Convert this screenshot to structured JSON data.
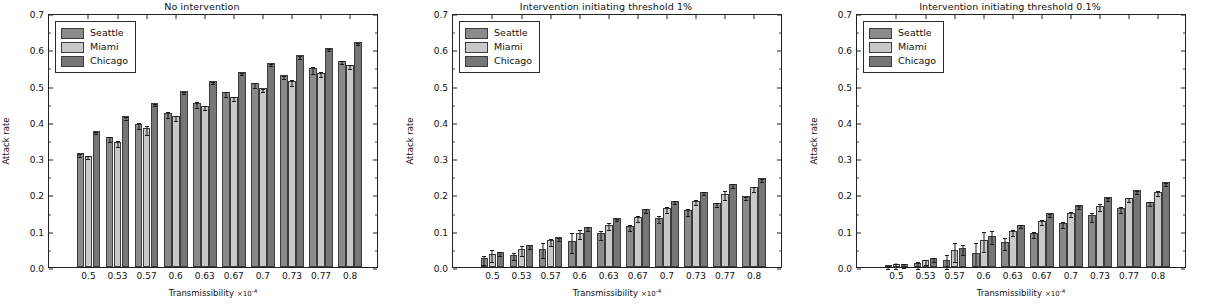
{
  "figure": {
    "xlabel": "Transmissibility",
    "xlabel_multiplier": "×10",
    "xlabel_exponent": "-4",
    "ylabel": "Attack rate"
  },
  "legend": {
    "entries": [
      {
        "label": "Seattle",
        "color": "#8a8a8a",
        "key": "seattle"
      },
      {
        "label": "Miami",
        "color": "#c9c9c9",
        "key": "miami"
      },
      {
        "label": "Chicago",
        "color": "#767676",
        "key": "chicago"
      }
    ]
  },
  "axis": {
    "yticks": [
      "0.0",
      "0.1",
      "0.2",
      "0.3",
      "0.4",
      "0.5",
      "0.6",
      "0.7"
    ],
    "ytick_values": [
      0.0,
      0.1,
      0.2,
      0.3,
      0.4,
      0.5,
      0.6,
      0.7
    ],
    "xticks": [
      "0.5",
      "0.53",
      "0.57",
      "0.6",
      "0.63",
      "0.67",
      "0.7",
      "0.73",
      "0.77",
      "0.8"
    ]
  },
  "chart_data": [
    {
      "type": "bar",
      "title": "No intervention",
      "xlabel": "Transmissibility ×10^-4",
      "ylabel": "Attack rate",
      "ylim": [
        0.0,
        0.7
      ],
      "grid": false,
      "legend_position": "upper left",
      "categories": [
        "0.5",
        "0.53",
        "0.57",
        "0.6",
        "0.63",
        "0.67",
        "0.7",
        "0.73",
        "0.77",
        "0.8"
      ],
      "series": [
        {
          "name": "Seattle",
          "values": [
            0.314,
            0.357,
            0.393,
            0.425,
            0.452,
            0.481,
            0.506,
            0.528,
            0.548,
            0.568
          ],
          "errors": [
            0.004,
            0.006,
            0.008,
            0.008,
            0.007,
            0.007,
            0.006,
            0.005,
            0.01,
            0.004
          ]
        },
        {
          "name": "Miami",
          "values": [
            0.307,
            0.345,
            0.382,
            0.415,
            0.444,
            0.469,
            0.492,
            0.513,
            0.536,
            0.556
          ],
          "errors": [
            0.005,
            0.008,
            0.013,
            0.008,
            0.005,
            0.005,
            0.005,
            0.008,
            0.006,
            0.006
          ]
        },
        {
          "name": "Chicago",
          "values": [
            0.375,
            0.415,
            0.452,
            0.484,
            0.512,
            0.538,
            0.562,
            0.583,
            0.603,
            0.621
          ],
          "errors": [
            0.003,
            0.003,
            0.003,
            0.003,
            0.003,
            0.003,
            0.003,
            0.003,
            0.003,
            0.003
          ]
        }
      ]
    },
    {
      "type": "bar",
      "title": "Intervention initiating threshold 1%",
      "xlabel": "Transmissibility ×10^-4",
      "ylabel": "Attack rate",
      "ylim": [
        0.0,
        0.7
      ],
      "grid": false,
      "legend_position": "upper left",
      "categories": [
        "0.5",
        "0.53",
        "0.57",
        "0.6",
        "0.63",
        "0.67",
        "0.7",
        "0.73",
        "0.77",
        "0.8"
      ],
      "series": [
        {
          "name": "Seattle",
          "values": [
            0.024,
            0.034,
            0.051,
            0.071,
            0.093,
            0.113,
            0.136,
            0.156,
            0.177,
            0.195
          ],
          "errors": [
            0.012,
            0.009,
            0.021,
            0.027,
            0.013,
            0.009,
            0.009,
            0.009,
            0.005,
            0.004
          ]
        },
        {
          "name": "Miami",
          "values": [
            0.035,
            0.05,
            0.074,
            0.095,
            0.117,
            0.138,
            0.162,
            0.183,
            0.202,
            0.22
          ],
          "errors": [
            0.017,
            0.013,
            0.01,
            0.013,
            0.01,
            0.008,
            0.008,
            0.007,
            0.013,
            0.007
          ]
        },
        {
          "name": "Chicago",
          "values": [
            0.042,
            0.06,
            0.082,
            0.11,
            0.134,
            0.16,
            0.183,
            0.208,
            0.228,
            0.245
          ],
          "errors": [
            0.005,
            0.005,
            0.004,
            0.005,
            0.003,
            0.005,
            0.004,
            0.004,
            0.005,
            0.004
          ]
        }
      ]
    },
    {
      "type": "bar",
      "title": "Intervention initiating threshold 0.1%",
      "xlabel": "Transmissibility ×10^-4",
      "ylabel": "Attack rate",
      "ylim": [
        0.0,
        0.7
      ],
      "grid": false,
      "legend_position": "upper left",
      "categories": [
        "0.5",
        "0.53",
        "0.57",
        "0.6",
        "0.63",
        "0.67",
        "0.7",
        "0.73",
        "0.77",
        "0.8"
      ],
      "series": [
        {
          "name": "Seattle",
          "values": [
            0.003,
            0.01,
            0.019,
            0.039,
            0.068,
            0.094,
            0.121,
            0.142,
            0.162,
            0.18
          ],
          "errors": [
            0.005,
            0.009,
            0.02,
            0.033,
            0.017,
            0.008,
            0.009,
            0.013,
            0.008,
            0.006
          ]
        },
        {
          "name": "Miami",
          "values": [
            0.007,
            0.018,
            0.046,
            0.074,
            0.099,
            0.128,
            0.15,
            0.169,
            0.19,
            0.208
          ],
          "errors": [
            0.008,
            0.008,
            0.026,
            0.027,
            0.008,
            0.007,
            0.008,
            0.01,
            0.006,
            0.006
          ]
        },
        {
          "name": "Chicago",
          "values": [
            0.008,
            0.025,
            0.052,
            0.086,
            0.117,
            0.148,
            0.17,
            0.192,
            0.212,
            0.234
          ],
          "errors": [
            0.006,
            0.005,
            0.014,
            0.018,
            0.005,
            0.004,
            0.004,
            0.004,
            0.004,
            0.004
          ]
        }
      ]
    }
  ]
}
